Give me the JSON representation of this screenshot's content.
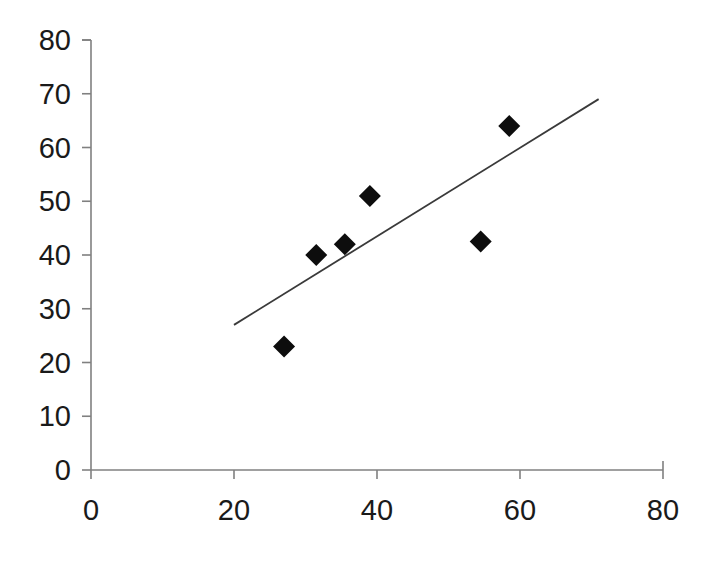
{
  "chart_data": {
    "type": "scatter",
    "title": "",
    "subtitle": "",
    "xlabel": "",
    "ylabel": "",
    "xlim": [
      0,
      80
    ],
    "ylim": [
      0,
      80
    ],
    "xticks": [
      0,
      20,
      40,
      60,
      80
    ],
    "yticks": [
      0,
      10,
      20,
      30,
      40,
      50,
      60,
      70,
      80
    ],
    "xtick_labels": [
      "0",
      "20",
      "40",
      "60",
      "80"
    ],
    "ytick_labels": [
      "0",
      "10",
      "20",
      "30",
      "40",
      "50",
      "60",
      "70",
      "80"
    ],
    "grid": false,
    "legend": false,
    "legend_position": "none",
    "marker_shape": "diamond",
    "marker_color": "#0d0d0d",
    "axis_color": "#808080",
    "series": [
      {
        "name": "data",
        "type": "scatter",
        "points": [
          {
            "x": 27.0,
            "y": 23.0
          },
          {
            "x": 31.5,
            "y": 40.0
          },
          {
            "x": 35.5,
            "y": 42.0
          },
          {
            "x": 39.0,
            "y": 51.0
          },
          {
            "x": 54.5,
            "y": 42.5
          },
          {
            "x": 58.5,
            "y": 64.0
          }
        ]
      },
      {
        "name": "trendline",
        "type": "line",
        "color": "#3a3a3a",
        "points": [
          {
            "x": 20.0,
            "y": 27.0
          },
          {
            "x": 71.0,
            "y": 69.0
          }
        ]
      }
    ],
    "annotations": []
  }
}
